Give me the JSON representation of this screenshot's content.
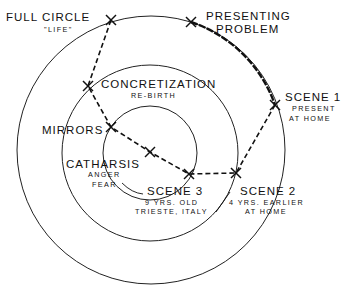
{
  "diagram": {
    "type": "concentric-circles-path",
    "circles": [
      {
        "name": "outer",
        "cx": 151,
        "cy": 150,
        "r": 134
      },
      {
        "name": "middle",
        "cx": 150,
        "cy": 153,
        "r": 88
      },
      {
        "name": "inner",
        "cx": 150,
        "cy": 153,
        "r": 47
      }
    ],
    "nodes": [
      {
        "id": "full-circle",
        "x": 111,
        "y": 20,
        "title": "FULL CIRCLE",
        "subtitle": "\"LIFE\""
      },
      {
        "id": "presenting-problem",
        "x": 191,
        "y": 22,
        "title": "PRESENTING",
        "title2": "PROBLEM"
      },
      {
        "id": "scene-1",
        "x": 275,
        "y": 105,
        "title": "SCENE 1",
        "subtitle": "PRESENT",
        "subtitle2": "AT HOME"
      },
      {
        "id": "scene-2",
        "x": 236,
        "y": 173,
        "title": "SCENE 2",
        "subtitle": "4 YRS. EARLIER",
        "subtitle2": "AT HOME"
      },
      {
        "id": "scene-3",
        "x": 189,
        "y": 174,
        "title": "SCENE 3",
        "subtitle": "9 YRS. OLD",
        "subtitle2": "TRIESTE, ITALY"
      },
      {
        "id": "catharsis",
        "x": 150,
        "y": 152,
        "title": "CATHARSIS",
        "subtitle": "ANGER",
        "subtitle2": "FEAR"
      },
      {
        "id": "mirrors",
        "x": 111,
        "y": 127,
        "title": "MIRRORS"
      },
      {
        "id": "concretization",
        "x": 88,
        "y": 86,
        "title": "CONCRETIZATION",
        "subtitle": "RE-BIRTH"
      }
    ],
    "path_order": [
      "presenting-problem",
      "scene-1",
      "scene-2",
      "scene-3",
      "catharsis",
      "mirrors",
      "concretization",
      "full-circle"
    ],
    "colors": {
      "line": "#111111",
      "background": "#ffffff"
    }
  }
}
